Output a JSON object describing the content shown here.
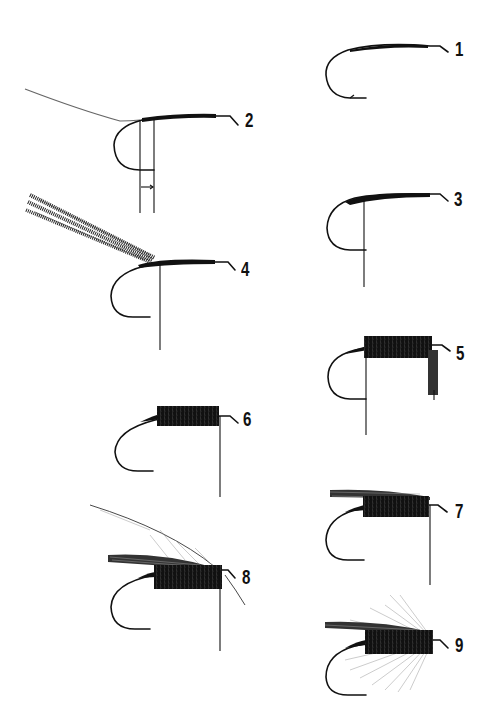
{
  "figure": {
    "background": "#ffffff",
    "ink_color": "#111111",
    "steps": [
      {
        "number": "1",
        "description": "Thread wrapped along hook shank"
      },
      {
        "number": "2",
        "description": "Tinsel tied in at bend, measurement lines shown"
      },
      {
        "number": "3",
        "description": "Tinsel wound, tip formed"
      },
      {
        "number": "4",
        "description": "Herl strands tied in at tail"
      },
      {
        "number": "5",
        "description": "Herl wound forward forming body"
      },
      {
        "number": "6",
        "description": "Body completed and trimmed"
      },
      {
        "number": "7",
        "description": "Wing fibres tied on top"
      },
      {
        "number": "8",
        "description": "Hackle feather tied in at head"
      },
      {
        "number": "9",
        "description": "Hackle wound, fly completed"
      }
    ]
  }
}
